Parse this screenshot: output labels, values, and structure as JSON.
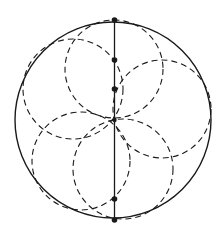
{
  "diagram": {
    "title": "",
    "width": 221,
    "height": 239,
    "stroke_color": "#1a1a1a",
    "outer_circle": {
      "cx": 113,
      "cy": 120,
      "r": 98
    },
    "diameter_line": {
      "x1": 114.5,
      "y1": 20,
      "x2": 114.5,
      "y2": 220
    },
    "inner_circles": [
      {
        "name": "top",
        "cx": 114,
        "cy": 69,
        "r": 49
      },
      {
        "name": "upper-left",
        "cx": 73,
        "cy": 89,
        "r": 50
      },
      {
        "name": "right",
        "cx": 162,
        "cy": 109,
        "r": 49
      },
      {
        "name": "lower-left",
        "cx": 81,
        "cy": 161,
        "r": 49
      },
      {
        "name": "lower-right",
        "cx": 123,
        "cy": 169,
        "r": 50
      }
    ],
    "points": [
      {
        "name": "top",
        "x": 114.5,
        "y": 20
      },
      {
        "name": "upper",
        "x": 114.5,
        "y": 60
      },
      {
        "name": "upper-mid",
        "x": 114.5,
        "y": 89
      },
      {
        "name": "center",
        "x": 114.5,
        "y": 120
      },
      {
        "name": "lower",
        "x": 114.5,
        "y": 199
      },
      {
        "name": "bottom",
        "x": 114.5,
        "y": 220
      }
    ],
    "dash_pattern": "6 4"
  }
}
